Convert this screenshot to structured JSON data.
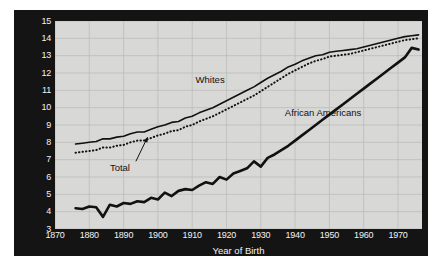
{
  "chart_data": {
    "type": "line",
    "title": "",
    "xlabel": "Year of Birth",
    "ylabel": "Years of Schooling at Age 35 Years",
    "xlim": [
      1870,
      1977
    ],
    "ylim": [
      3,
      15
    ],
    "xticks": [
      1870,
      1880,
      1890,
      1900,
      1910,
      1920,
      1930,
      1940,
      1950,
      1960,
      1970
    ],
    "yticks": [
      3,
      4,
      5,
      6,
      7,
      8,
      9,
      10,
      11,
      12,
      13,
      14,
      15
    ],
    "grid": true,
    "legend_position": "inline-annotations",
    "annotations": [
      {
        "text": "Whites",
        "x": 1911,
        "y": 11.6
      },
      {
        "text": "African Americans",
        "x": 1937,
        "y": 9.7
      },
      {
        "text": "Total",
        "x": 1886,
        "y": 6.5,
        "leader_to": {
          "x": 1897,
          "y": 8.3
        }
      }
    ],
    "x": [
      1876,
      1878,
      1880,
      1882,
      1884,
      1886,
      1888,
      1890,
      1892,
      1894,
      1896,
      1898,
      1900,
      1902,
      1904,
      1906,
      1908,
      1910,
      1912,
      1914,
      1916,
      1918,
      1920,
      1922,
      1924,
      1926,
      1928,
      1930,
      1932,
      1934,
      1936,
      1938,
      1940,
      1942,
      1944,
      1946,
      1948,
      1950,
      1952,
      1954,
      1956,
      1958,
      1960,
      1962,
      1964,
      1966,
      1968,
      1970,
      1972,
      1974,
      1976
    ],
    "series": [
      {
        "name": "Whites",
        "style": "solid",
        "color": "#111111",
        "values": [
          7.9,
          7.95,
          8.0,
          8.05,
          8.2,
          8.2,
          8.3,
          8.35,
          8.5,
          8.6,
          8.6,
          8.75,
          8.9,
          9.0,
          9.15,
          9.2,
          9.4,
          9.5,
          9.7,
          9.85,
          10.0,
          10.2,
          10.4,
          10.6,
          10.8,
          11.0,
          11.2,
          11.45,
          11.7,
          11.9,
          12.1,
          12.35,
          12.5,
          12.7,
          12.85,
          13.0,
          13.05,
          13.2,
          13.25,
          13.3,
          13.35,
          13.4,
          13.5,
          13.6,
          13.7,
          13.8,
          13.9,
          14.0,
          14.1,
          14.15,
          14.2
        ]
      },
      {
        "name": "Total",
        "style": "dotted",
        "color": "#111111",
        "values": [
          7.4,
          7.45,
          7.5,
          7.55,
          7.7,
          7.7,
          7.8,
          7.85,
          8.0,
          8.1,
          8.1,
          8.25,
          8.4,
          8.5,
          8.65,
          8.7,
          8.9,
          9.0,
          9.2,
          9.35,
          9.5,
          9.7,
          9.9,
          10.1,
          10.3,
          10.5,
          10.7,
          10.95,
          11.2,
          11.45,
          11.7,
          11.95,
          12.15,
          12.35,
          12.55,
          12.7,
          12.8,
          12.95,
          13.0,
          13.05,
          13.1,
          13.2,
          13.3,
          13.4,
          13.5,
          13.6,
          13.7,
          13.8,
          13.9,
          13.95,
          14.0
        ]
      },
      {
        "name": "African Americans",
        "style": "solid-bold",
        "color": "#111111",
        "values": [
          4.2,
          4.15,
          4.3,
          4.25,
          3.7,
          4.4,
          4.3,
          4.5,
          4.45,
          4.6,
          4.55,
          4.8,
          4.7,
          5.1,
          4.9,
          5.2,
          5.3,
          5.25,
          5.5,
          5.7,
          5.6,
          6.0,
          5.85,
          6.2,
          6.35,
          6.5,
          6.9,
          6.6,
          7.1,
          7.3,
          7.55,
          7.8,
          8.1,
          8.4,
          8.7,
          9.0,
          9.3,
          9.6,
          9.9,
          10.2,
          10.5,
          10.8,
          11.1,
          11.4,
          11.7,
          12.0,
          12.3,
          12.6,
          12.9,
          13.45,
          13.35
        ]
      }
    ]
  },
  "axis": {
    "y_title": "Years of Schooling at Age 35 Years",
    "x_title": "Year of Birth",
    "y_tick_labels": [
      "15",
      "14",
      "13",
      "12",
      "11",
      "10",
      "9",
      "8",
      "7",
      "6",
      "5",
      "4",
      "3"
    ],
    "x_tick_labels": [
      "1870",
      "1880",
      "1890",
      "1900",
      "1910",
      "1920",
      "1930",
      "1940",
      "1950",
      "1960",
      "1970"
    ]
  },
  "colors": {
    "panel_background": "#141414",
    "plot_background": "#d8d8d6",
    "grid": "#b9b9b7",
    "line": "#111111",
    "tick_text": "#f2f2f2",
    "annotation_text": "#111111"
  }
}
